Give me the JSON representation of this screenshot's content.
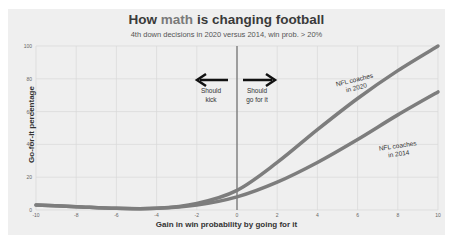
{
  "chart_data": {
    "type": "line",
    "title": "How math is changing football",
    "title_parts": {
      "pre": "How ",
      "highlight": "math",
      "post": " is changing football"
    },
    "subtitle": "4th down decisions in 2020 versus 2014, win prob. > 20%",
    "xlabel": "Gain in win probability by going for it",
    "ylabel": "Go-for-it percentage",
    "xlim": [
      -10,
      10
    ],
    "ylim": [
      0,
      100
    ],
    "xticks": [
      -10,
      -8,
      -6,
      -4,
      -2,
      0,
      2,
      4,
      6,
      8,
      10
    ],
    "yticks": [
      0,
      20,
      40,
      60,
      80,
      100
    ],
    "grid": true,
    "x": [
      -10,
      -8,
      -6,
      -4,
      -2,
      0,
      2,
      4,
      6,
      8,
      10
    ],
    "series": [
      {
        "name": "NFL coaches in 2020",
        "values": [
          3,
          2,
          1,
          1,
          4,
          12,
          29,
          49,
          68,
          85,
          100
        ],
        "color": "#7d7d7d"
      },
      {
        "name": "NFL coaches in 2014",
        "values": [
          3,
          2,
          1,
          1,
          3,
          8,
          17,
          29,
          43,
          58,
          72
        ],
        "color": "#7d7d7d"
      }
    ],
    "annotations": [
      {
        "text_lines": [
          "Should",
          "kick"
        ],
        "arrow": "left"
      },
      {
        "text_lines": [
          "Should",
          "go for it"
        ],
        "arrow": "right"
      },
      {
        "text_lines": [
          "NFL coaches",
          "in 2020"
        ]
      },
      {
        "text_lines": [
          "NFL coaches",
          "in 2014"
        ]
      }
    ],
    "vline_x": 0
  },
  "labels": {
    "kick_1": "Should",
    "kick_2": "kick",
    "go_1": "Should",
    "go_2": "go for it",
    "c2020_1": "NFL coaches",
    "c2020_2": "in 2020",
    "c2014_1": "NFL coaches",
    "c2014_2": "in 2014"
  }
}
